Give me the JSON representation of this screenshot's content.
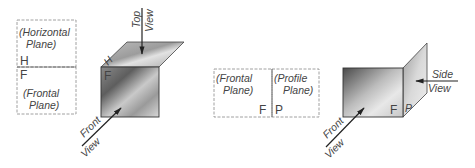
{
  "figure": {
    "left_panel": {
      "fold_diagram": {
        "upper_label_line1": "(Horizontal",
        "upper_label_line2": "Plane)",
        "upper_letter": "H",
        "lower_letter": "F",
        "lower_label_line1": "(Frontal",
        "lower_label_line2": "Plane)"
      },
      "pictorial": {
        "top_arrow_label_1": "Top",
        "top_arrow_label_2": "View",
        "front_arrow_label_1": "Front",
        "front_arrow_label_2": "View",
        "front_face_letter": "F",
        "top_face_letter": "H"
      }
    },
    "right_panel": {
      "fold_diagram": {
        "left_label_line1": "(Frontal",
        "left_label_line2": "Plane)",
        "left_letter": "F",
        "right_label_line1": "(Profile",
        "right_label_line2": "Plane)",
        "right_letter": "P"
      },
      "pictorial": {
        "side_arrow_label_1": "Side",
        "side_arrow_label_2": "View",
        "front_arrow_label_1": "Front",
        "front_arrow_label_2": "View",
        "front_face_letter": "F",
        "side_face_letter": "P"
      }
    }
  },
  "colors": {
    "plane_dark": "#6e6e6e",
    "plane_light": "#e6e6e6",
    "line": "#333333"
  }
}
